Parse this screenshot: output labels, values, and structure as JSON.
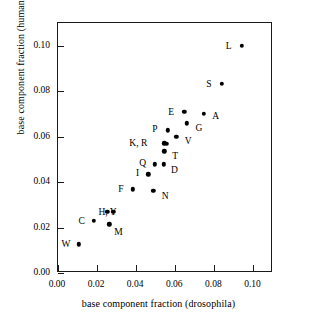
{
  "chart_data": {
    "type": "scatter",
    "title": "",
    "xlabel": "base component fraction (drosophila)",
    "ylabel": "base component fraction (human)",
    "xlim": [
      0.0,
      0.11
    ],
    "ylim": [
      0.0,
      0.11
    ],
    "xticks": [
      "0.00",
      "0.02",
      "0.04",
      "0.06",
      "0.08",
      "0.10"
    ],
    "xtick_values": [
      0.0,
      0.02,
      0.04,
      0.06,
      0.08,
      0.1
    ],
    "yticks": [
      "0.00",
      "0.02",
      "0.04",
      "0.06",
      "0.08",
      "0.10"
    ],
    "ytick_values": [
      0.0,
      0.02,
      0.04,
      0.06,
      0.08,
      0.1
    ],
    "grid": false,
    "legend": false,
    "marker_color": "#000000",
    "axis_color": "#1a1a1a",
    "background": "#ffffff",
    "points": [
      {
        "label": "L",
        "x": 0.094,
        "y": 0.1,
        "label_dx": -13,
        "label_dy": 0
      },
      {
        "label": "S",
        "x": 0.0838,
        "y": 0.0832,
        "label_dx": -13,
        "label_dy": 0
      },
      {
        "label": "E",
        "x": 0.0646,
        "y": 0.0708,
        "label_dx": -13,
        "label_dy": 0
      },
      {
        "label": "A",
        "x": 0.0745,
        "y": 0.07,
        "label_dx": 12,
        "label_dy": 2
      },
      {
        "label": "G",
        "x": 0.066,
        "y": 0.0658,
        "label_dx": 12,
        "label_dy": 5
      },
      {
        "label": "P",
        "x": 0.0562,
        "y": 0.0628,
        "label_dx": -13,
        "label_dy": -1
      },
      {
        "label": "V",
        "x": 0.0605,
        "y": 0.0598,
        "label_dx": 12,
        "label_dy": 4
      },
      {
        "label": "K, R",
        "x": 0.0544,
        "y": 0.057,
        "label_dx": -26,
        "label_dy": 0
      },
      {
        "label": "",
        "x": 0.0556,
        "y": 0.0568,
        "label_dx": 0,
        "label_dy": 0
      },
      {
        "label": "T",
        "x": 0.0543,
        "y": 0.0535,
        "label_dx": 11,
        "label_dy": 5
      },
      {
        "label": "Q",
        "x": 0.0495,
        "y": 0.0479,
        "label_dx": -12,
        "label_dy": -1
      },
      {
        "label": "D",
        "x": 0.054,
        "y": 0.0478,
        "label_dx": 11,
        "label_dy": 6
      },
      {
        "label": "I",
        "x": 0.0463,
        "y": 0.0435,
        "label_dx": -11,
        "label_dy": -1
      },
      {
        "label": "F",
        "x": 0.0383,
        "y": 0.0368,
        "label_dx": -12,
        "label_dy": 0
      },
      {
        "label": "N",
        "x": 0.0487,
        "y": 0.0362,
        "label_dx": 12,
        "label_dy": 5
      },
      {
        "label": "H, Y",
        "x": 0.0253,
        "y": 0.0268,
        "label_dx": 0,
        "label_dy": 0
      },
      {
        "label": "",
        "x": 0.0282,
        "y": 0.027,
        "label_dx": 27,
        "label_dy": 0
      },
      {
        "label": "C",
        "x": 0.0182,
        "y": 0.0229,
        "label_dx": -12,
        "label_dy": 0
      },
      {
        "label": "M",
        "x": 0.0263,
        "y": 0.0215,
        "label_dx": 9,
        "label_dy": 8
      },
      {
        "label": "W",
        "x": 0.0108,
        "y": 0.0127,
        "label_dx": -13,
        "label_dy": 0
      }
    ]
  }
}
